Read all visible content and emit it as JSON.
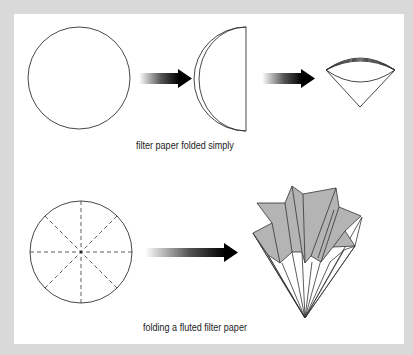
{
  "diagram": {
    "colors": {
      "background": "#d9d9d9",
      "panel": "#ffffff",
      "line": "#333333",
      "fold_fill": "#b4b4b4",
      "arrow_dark": "#000000"
    },
    "rows": [
      {
        "id": "simple",
        "caption": "filter paper folded simply",
        "steps": [
          "circle",
          "half-circle",
          "cone"
        ],
        "arrows": 2
      },
      {
        "id": "fluted",
        "caption": "folding a fluted filter paper",
        "steps": [
          "circle-with-8-dashed-fold-lines",
          "fluted-cone"
        ],
        "arrows": 1
      }
    ]
  }
}
